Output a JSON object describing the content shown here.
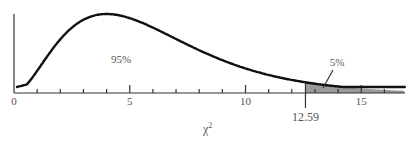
{
  "chart_data": {
    "type": "area",
    "title": "",
    "distribution": "chi-square",
    "degrees_of_freedom": 6,
    "xlabel": "χ²",
    "xlabel_base": "χ",
    "xlabel_sup": "2",
    "ylabel": "",
    "xlim": [
      0,
      17
    ],
    "x_ticks_minor": [
      1,
      2,
      3,
      4,
      6,
      7,
      8,
      9,
      11,
      12,
      13,
      14,
      16
    ],
    "x_ticks_major": [
      0,
      5,
      10,
      15
    ],
    "x_tick_labels": [
      "0",
      "5",
      "10",
      "15"
    ],
    "critical_value": 12.59,
    "critical_value_label": "12.59",
    "regions": [
      {
        "name": "acceptance",
        "from": 0,
        "to": 12.59,
        "percent_label": "95%",
        "shaded": false
      },
      {
        "name": "rejection",
        "from": 12.59,
        "to": 17,
        "percent_label": "5%",
        "shaded": true
      }
    ],
    "grid": false,
    "legend": null,
    "colors": {
      "curve": "#111111",
      "axis": "#333333",
      "shade": "#9a9a9a",
      "text": "#555555"
    }
  }
}
